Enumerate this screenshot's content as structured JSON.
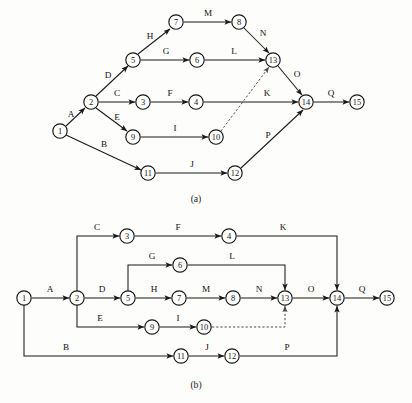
{
  "figure": {
    "captions": [
      {
        "text": "(a)",
        "x": 196,
        "y": 202
      },
      {
        "text": "(b)",
        "x": 196,
        "y": 388
      }
    ]
  },
  "diagram_a": {
    "caption": "(a)",
    "node_radius": 7.2,
    "nodes": [
      {
        "id": "1",
        "label": "1",
        "x": 60,
        "y": 131
      },
      {
        "id": "2",
        "label": "2",
        "x": 91,
        "y": 102
      },
      {
        "id": "3",
        "label": "3",
        "x": 143,
        "y": 102
      },
      {
        "id": "4",
        "label": "4",
        "x": 196,
        "y": 102
      },
      {
        "id": "5",
        "label": "5",
        "x": 133,
        "y": 60
      },
      {
        "id": "6",
        "label": "6",
        "x": 197,
        "y": 60
      },
      {
        "id": "7",
        "label": "7",
        "x": 176,
        "y": 22
      },
      {
        "id": "8",
        "label": "8",
        "x": 239,
        "y": 22
      },
      {
        "id": "9",
        "label": "9",
        "x": 133,
        "y": 137
      },
      {
        "id": "10",
        "label": "10",
        "x": 216,
        "y": 137
      },
      {
        "id": "11",
        "label": "11",
        "x": 148,
        "y": 173
      },
      {
        "id": "12",
        "label": "12",
        "x": 235,
        "y": 173
      },
      {
        "id": "13",
        "label": "13",
        "x": 273,
        "y": 60
      },
      {
        "id": "14",
        "label": "14",
        "x": 306,
        "y": 102
      },
      {
        "id": "15",
        "label": "15",
        "x": 357,
        "y": 102
      }
    ],
    "edges": [
      {
        "label": "A",
        "from": "1",
        "to": "2",
        "lx": 71,
        "ly": 117,
        "dashed": false
      },
      {
        "label": "B",
        "from": "1",
        "to": "11",
        "lx": 104,
        "ly": 147,
        "dashed": false
      },
      {
        "label": "C",
        "from": "2",
        "to": "3",
        "lx": 117,
        "ly": 96,
        "dashed": false
      },
      {
        "label": "D",
        "from": "2",
        "to": "5",
        "lx": 108,
        "ly": 78,
        "dashed": false
      },
      {
        "label": "E",
        "from": "2",
        "to": "9",
        "lx": 117,
        "ly": 120,
        "dashed": false
      },
      {
        "label": "F",
        "from": "3",
        "to": "4",
        "lx": 170,
        "ly": 96,
        "dashed": false
      },
      {
        "label": "G",
        "from": "5",
        "to": "6",
        "lx": 166,
        "ly": 54,
        "dashed": false
      },
      {
        "label": "H",
        "from": "5",
        "to": "7",
        "lx": 150,
        "ly": 39,
        "dashed": false
      },
      {
        "label": "I",
        "from": "9",
        "to": "10",
        "lx": 175,
        "ly": 131,
        "dashed": false
      },
      {
        "label": "J",
        "from": "11",
        "to": "12",
        "lx": 192,
        "ly": 167,
        "dashed": false
      },
      {
        "label": "K",
        "from": "4",
        "to": "14",
        "lx": 267,
        "ly": 96,
        "dashed": false
      },
      {
        "label": "L",
        "from": "6",
        "to": "13",
        "lx": 234,
        "ly": 54,
        "dashed": false
      },
      {
        "label": "M",
        "from": "7",
        "to": "8",
        "lx": 208,
        "ly": 16,
        "dashed": false
      },
      {
        "label": "N",
        "from": "8",
        "to": "13",
        "lx": 263,
        "ly": 36,
        "dashed": false
      },
      {
        "label": "O",
        "from": "13",
        "to": "14",
        "lx": 297,
        "ly": 77,
        "dashed": false
      },
      {
        "label": "P",
        "from": "12",
        "to": "14",
        "lx": 268,
        "ly": 138,
        "dashed": false
      },
      {
        "label": "Q",
        "from": "14",
        "to": "15",
        "lx": 331,
        "ly": 96,
        "dashed": false
      },
      {
        "label": "",
        "from": "10",
        "to": "13",
        "lx": 0,
        "ly": 0,
        "dashed": true
      }
    ]
  },
  "diagram_b": {
    "caption": "(b)",
    "node_radius": 7.2,
    "nodes": [
      {
        "id": "1",
        "label": "1",
        "x": 24,
        "y": 298
      },
      {
        "id": "2",
        "label": "2",
        "x": 77,
        "y": 298
      },
      {
        "id": "3",
        "label": "3",
        "x": 127,
        "y": 236
      },
      {
        "id": "4",
        "label": "4",
        "x": 229,
        "y": 236
      },
      {
        "id": "5",
        "label": "5",
        "x": 128,
        "y": 298
      },
      {
        "id": "6",
        "label": "6",
        "x": 180,
        "y": 265
      },
      {
        "id": "7",
        "label": "7",
        "x": 179,
        "y": 298
      },
      {
        "id": "8",
        "label": "8",
        "x": 233,
        "y": 298
      },
      {
        "id": "9",
        "label": "9",
        "x": 152,
        "y": 327
      },
      {
        "id": "10",
        "label": "10",
        "x": 204,
        "y": 327
      },
      {
        "id": "11",
        "label": "11",
        "x": 181,
        "y": 356
      },
      {
        "id": "12",
        "label": "12",
        "x": 232,
        "y": 356
      },
      {
        "id": "13",
        "label": "13",
        "x": 285,
        "y": 298
      },
      {
        "id": "14",
        "label": "14",
        "x": 337,
        "y": 298
      },
      {
        "id": "15",
        "label": "15",
        "x": 387,
        "y": 298
      }
    ],
    "edges": [
      {
        "label": "A",
        "from": "1",
        "to": "2",
        "lx": 50,
        "ly": 292,
        "dashed": false
      },
      {
        "label": "B",
        "from": "1",
        "to": "11",
        "lx": 66,
        "ly": 350,
        "dashed": false
      },
      {
        "label": "C",
        "from": "2",
        "to": "3",
        "lx": 97,
        "ly": 230,
        "dashed": false
      },
      {
        "label": "D",
        "from": "2",
        "to": "5",
        "lx": 102,
        "ly": 292,
        "dashed": false
      },
      {
        "label": "E",
        "from": "2",
        "to": "9",
        "lx": 100,
        "ly": 321,
        "dashed": false
      },
      {
        "label": "F",
        "from": "3",
        "to": "4",
        "lx": 178,
        "ly": 230,
        "dashed": false
      },
      {
        "label": "G",
        "from": "5",
        "to": "6",
        "lx": 152,
        "ly": 259,
        "dashed": false
      },
      {
        "label": "H",
        "from": "5",
        "to": "7",
        "lx": 154,
        "ly": 292,
        "dashed": false
      },
      {
        "label": "I",
        "from": "9",
        "to": "10",
        "lx": 178,
        "ly": 321,
        "dashed": false
      },
      {
        "label": "J",
        "from": "11",
        "to": "12",
        "lx": 207,
        "ly": 350,
        "dashed": false
      },
      {
        "label": "K",
        "from": "4",
        "to": "14",
        "lx": 283,
        "ly": 230,
        "dashed": false
      },
      {
        "label": "L",
        "from": "6",
        "to": "13",
        "lx": 232,
        "ly": 259,
        "dashed": false
      },
      {
        "label": "M",
        "from": "7",
        "to": "8",
        "lx": 206,
        "ly": 292,
        "dashed": false
      },
      {
        "label": "N",
        "from": "8",
        "to": "13",
        "lx": 259,
        "ly": 292,
        "dashed": false
      },
      {
        "label": "O",
        "from": "13",
        "to": "14",
        "lx": 311,
        "ly": 292,
        "dashed": false
      },
      {
        "label": "P",
        "from": "12",
        "to": "14",
        "lx": 287,
        "ly": 350,
        "dashed": false
      },
      {
        "label": "Q",
        "from": "14",
        "to": "15",
        "lx": 362,
        "ly": 292,
        "dashed": false
      },
      {
        "label": "",
        "from": "10",
        "to": "13",
        "lx": 0,
        "ly": 0,
        "dashed": true
      }
    ]
  },
  "colors": {
    "background": "#fdfdfc",
    "stroke": "#1a1a1a",
    "node_fill": "#ffffff",
    "dashed_stroke": "#4a4a4a",
    "text": "#121212"
  }
}
